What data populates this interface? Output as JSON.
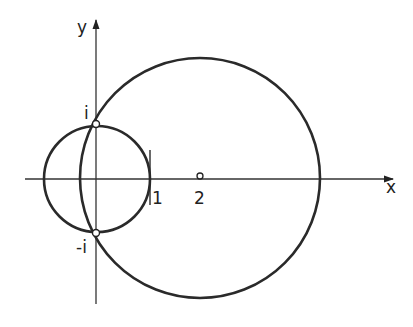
{
  "diagram": {
    "colors": {
      "stroke": "#2a2a2a",
      "axis": "#333333",
      "background": "#ffffff"
    },
    "axes": {
      "x_label": "x",
      "y_label": "y"
    },
    "labels": {
      "i": "i",
      "minus_i": "-i",
      "one": "1",
      "two": "2"
    },
    "points": [
      {
        "name": "i",
        "re": 0,
        "im": 1
      },
      {
        "name": "-i",
        "re": 0,
        "im": -1
      },
      {
        "name": "2",
        "re": 2,
        "im": 0
      }
    ],
    "circles": [
      {
        "name": "unit-circle",
        "center_re": 0,
        "center_im": 0,
        "radius": 1
      },
      {
        "name": "large-circle",
        "center_re": 2,
        "center_im": 0,
        "radius": 2.236
      }
    ],
    "segments": [
      {
        "name": "line-re-1",
        "re": 1,
        "im_from": -0.5,
        "im_to": 0.55
      }
    ]
  }
}
